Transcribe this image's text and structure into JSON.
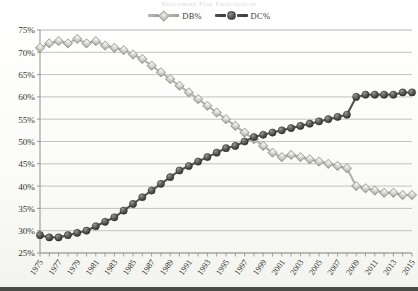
{
  "ghost_title": "Retirement Plan Participation",
  "legend": {
    "position": "top-center",
    "entries": [
      {
        "label": "DB%",
        "marker": "diamond",
        "color": "#c3c3bd"
      },
      {
        "label": "DC%",
        "marker": "circle",
        "color": "#4d4d4a"
      }
    ]
  },
  "axes": {
    "y_ticks": [
      "25%",
      "30%",
      "35%",
      "40%",
      "45%",
      "50%",
      "55%",
      "60%",
      "65%",
      "70%",
      "75%"
    ],
    "x_ticks": [
      "1975",
      "1977",
      "1979",
      "1981",
      "1983",
      "1985",
      "1987",
      "1989",
      "1991",
      "1993",
      "1995",
      "1997",
      "1999",
      "2001",
      "2003",
      "2005",
      "2007",
      "2009",
      "2011",
      "2013",
      "2015"
    ]
  },
  "chart_data": {
    "type": "line",
    "title": "",
    "xlabel": "",
    "ylabel": "",
    "ylim": [
      25,
      75
    ],
    "ytick_step": 5,
    "grid": true,
    "legend_position": "top-center",
    "x": [
      1975,
      1976,
      1977,
      1978,
      1979,
      1980,
      1981,
      1982,
      1983,
      1984,
      1985,
      1986,
      1987,
      1988,
      1989,
      1990,
      1991,
      1992,
      1993,
      1994,
      1995,
      1996,
      1997,
      1998,
      1999,
      2000,
      2001,
      2002,
      2003,
      2004,
      2005,
      2006,
      2007,
      2008,
      2009,
      2010,
      2011,
      2012,
      2013,
      2014,
      2015
    ],
    "series": [
      {
        "name": "DB%",
        "marker": "diamond",
        "color": "#c3c3bd",
        "values": [
          71,
          72,
          72.5,
          72,
          73,
          72,
          72.5,
          71.5,
          71,
          70.5,
          69.5,
          68.5,
          67,
          65.5,
          64,
          62.5,
          61,
          59.5,
          58,
          56.5,
          55,
          53.5,
          52,
          50.5,
          49,
          47.5,
          46.5,
          47,
          46.5,
          46,
          45.5,
          45,
          44.5,
          44,
          40,
          39.5,
          39,
          38.5,
          38.5,
          38,
          38
        ]
      },
      {
        "name": "DC%",
        "marker": "circle",
        "color": "#4d4d4a",
        "values": [
          29,
          28.5,
          28.5,
          29,
          29.5,
          30,
          31,
          32,
          33,
          34.5,
          36,
          37.5,
          39,
          40.5,
          42,
          43.5,
          44.5,
          45.5,
          46.5,
          47.5,
          48.5,
          49,
          50,
          51,
          51.5,
          52,
          52.5,
          53,
          53.5,
          54,
          54.5,
          55,
          55.5,
          56,
          60,
          60.5,
          60.5,
          60.5,
          60.5,
          61,
          61
        ]
      }
    ]
  }
}
